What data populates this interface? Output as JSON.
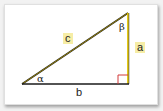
{
  "diagram": {
    "type": "right-triangle",
    "labels": {
      "hypotenuse": "c",
      "vertical_leg": "a",
      "horizontal_leg": "b",
      "angle_left": "α",
      "angle_top": "β"
    },
    "colors": {
      "hypotenuse": "#c9a800",
      "vertical_leg": "#e8c800",
      "base": "#222222",
      "right_angle_marker": "#d23a3a",
      "label_bg": "#f6eda6"
    }
  }
}
